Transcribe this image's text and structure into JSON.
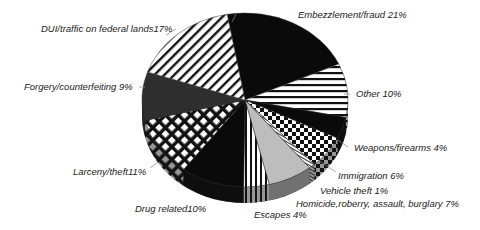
{
  "chart_data": {
    "type": "pie",
    "title": "",
    "start_angle_deg": -10,
    "direction": "clockwise",
    "slices": [
      {
        "label": "Embezzlement/fraud",
        "value": 21,
        "display": "Embezzlement/fraud 21%",
        "pattern": "solid-black"
      },
      {
        "label": "Other",
        "value": 10,
        "display": "Other 10%",
        "pattern": "horizontal-stripes"
      },
      {
        "label": "Weapons/firearms",
        "value": 4,
        "display": "Weapons/firearms 4%",
        "pattern": "solid-black"
      },
      {
        "label": "Immigration",
        "value": 6,
        "display": "Immigration 6%",
        "pattern": "checkerboard"
      },
      {
        "label": "Vehicle theft",
        "value": 1,
        "display": "Vehicle theft 1%",
        "pattern": "fine-hatch"
      },
      {
        "label": "Homicide,roberry, assault, burglary",
        "value": 7,
        "display": "Homicide,roberry, assault, burglary 7%",
        "pattern": "light-gray"
      },
      {
        "label": "Escapes",
        "value": 4,
        "display": "Escapes 4%",
        "pattern": "vertical-stripes"
      },
      {
        "label": "Drug related",
        "value": 10,
        "display": "Drug related10%",
        "pattern": "solid-black"
      },
      {
        "label": "Larceny/theft",
        "value": 11,
        "display": "Larceny/theft11%",
        "pattern": "diamond-lattice"
      },
      {
        "label": "Forgery/counterfeiting",
        "value": 9,
        "display": "Forgery/counterfeiting 9%",
        "pattern": "dark-gray"
      },
      {
        "label": "DUI/traffic on federal lands",
        "value": 17,
        "display": "DUI/traffic on federal lands17%",
        "pattern": "diagonal-stripes"
      }
    ],
    "legend": "none (leader-line labels)",
    "style": "3D tilted pie"
  },
  "labels": {
    "embezzlement": "Embezzlement/fraud 21%",
    "other": "Other 10%",
    "weapons": "Weapons/firearms 4%",
    "immigration": "Immigration 6%",
    "vehicle": "Vehicle theft 1%",
    "homicide": "Homicide,roberry, assault, burglary 7%",
    "escapes": "Escapes 4%",
    "drug": "Drug related10%",
    "larceny": "Larceny/theft11%",
    "forgery": "Forgery/counterfeiting 9%",
    "dui": "DUI/traffic on federal lands17%"
  }
}
